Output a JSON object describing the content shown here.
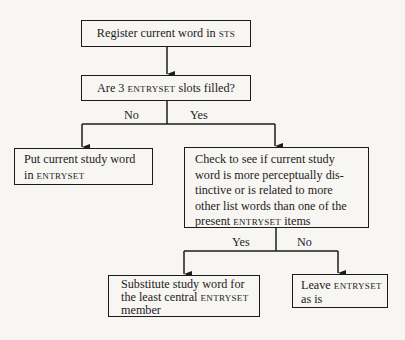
{
  "diagram": {
    "type": "flowchart",
    "nodes": {
      "register": {
        "text": "Register current word in",
        "sc": "STS"
      },
      "question": {
        "pre": "Are 3 ",
        "sc": "ENTRYSET",
        "post": " slots filled?"
      },
      "put": {
        "line1": "Put current study word",
        "line2_pre": "in ",
        "sc": "ENTRYSET"
      },
      "check": {
        "line1": "Check to see if current study",
        "line2": "word is more perceptually dis-",
        "line3": "tinctive or is related to more",
        "line4": "other list words than one of the",
        "line5_pre": "present ",
        "sc": "ENTRYSET",
        "line5_post": " items"
      },
      "substitute": {
        "line1": "Substitute study word for",
        "line2_pre": "the least central ",
        "sc": "ENTRYSET",
        "line3": "member"
      },
      "leave": {
        "line1_pre": "Leave ",
        "sc": "ENTRYSET",
        "line2": "as is"
      }
    },
    "edge_labels": {
      "q_no": "No",
      "q_yes": "Yes",
      "c_yes": "Yes",
      "c_no": "No"
    }
  }
}
